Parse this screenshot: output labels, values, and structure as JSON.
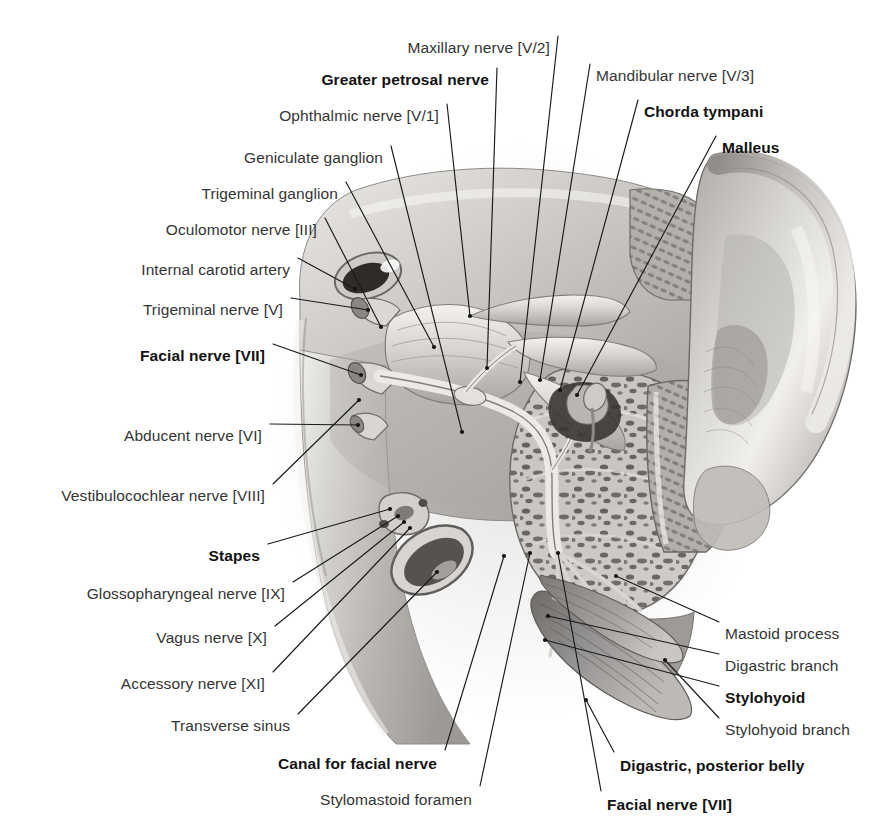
{
  "figure": {
    "domain": "anatomical-illustration",
    "background_color": "#ffffff",
    "label_color": "#343434",
    "bold_label_color": "#121212",
    "leader_line_color": "#1a1a1a",
    "style": "grayscale airbrush medical atlas plate"
  },
  "labels": [
    {
      "id": "maxillary-nerve",
      "text": "Maxillary nerve [V/2]",
      "bold": false,
      "align": "right",
      "x": 550,
      "y": 40,
      "leader": [
        [
          558,
          36
        ],
        [
          520,
          382
        ]
      ]
    },
    {
      "id": "greater-petrosal-nerve",
      "text": "Greater petrosal nerve",
      "bold": true,
      "align": "right",
      "x": 489,
      "y": 72,
      "leader": [
        [
          497,
          68
        ],
        [
          487,
          368
        ]
      ]
    },
    {
      "id": "ophthalmic-nerve",
      "text": "Ophthalmic nerve [V/1]",
      "bold": false,
      "align": "right",
      "x": 439,
      "y": 108,
      "leader": [
        [
          447,
          104
        ],
        [
          470,
          316
        ]
      ]
    },
    {
      "id": "geniculate-ganglion",
      "text": "Geniculate ganglion",
      "bold": false,
      "align": "right",
      "x": 383,
      "y": 150,
      "leader": [
        [
          391,
          146
        ],
        [
          462,
          432
        ]
      ]
    },
    {
      "id": "trigeminal-ganglion",
      "text": "Trigeminal ganglion",
      "bold": false,
      "align": "right",
      "x": 338,
      "y": 186,
      "leader": [
        [
          346,
          182
        ],
        [
          434,
          347
        ]
      ]
    },
    {
      "id": "oculomotor-nerve",
      "text": "Oculomotor nerve [III]",
      "bold": false,
      "align": "right",
      "x": 317,
      "y": 222,
      "leader": [
        [
          325,
          218
        ],
        [
          381,
          327
        ]
      ]
    },
    {
      "id": "internal-carotid-artery",
      "text": "Internal carotid artery",
      "bold": false,
      "align": "right",
      "x": 290,
      "y": 262,
      "leader": [
        [
          298,
          258
        ],
        [
          355,
          289
        ]
      ]
    },
    {
      "id": "trigeminal-nerve",
      "text": "Trigeminal nerve [V]",
      "bold": false,
      "align": "right",
      "x": 283,
      "y": 302,
      "leader": [
        [
          291,
          298
        ],
        [
          368,
          310
        ]
      ]
    },
    {
      "id": "facial-nerve-vii-left",
      "text": "Facial nerve [VII]",
      "bold": true,
      "align": "right",
      "x": 265,
      "y": 348,
      "leader": [
        [
          273,
          344
        ],
        [
          361,
          375
        ]
      ]
    },
    {
      "id": "abducent-nerve",
      "text": "Abducent nerve [VI]",
      "bold": false,
      "align": "right",
      "x": 262,
      "y": 428,
      "leader": [
        [
          270,
          424
        ],
        [
          358,
          425
        ]
      ]
    },
    {
      "id": "vestibulocochlear-nerve",
      "text": "Vestibulocochlear nerve [VIII]",
      "bold": false,
      "align": "right",
      "x": 265,
      "y": 488,
      "leader": [
        [
          273,
          484
        ],
        [
          359,
          400
        ]
      ]
    },
    {
      "id": "stapes",
      "text": "Stapes",
      "bold": true,
      "align": "right",
      "x": 260,
      "y": 548,
      "leader": [
        [
          268,
          544
        ],
        [
          390,
          509
        ]
      ]
    },
    {
      "id": "glossopharyngeal-nerve",
      "text": "Glossopharyngeal nerve [IX]",
      "bold": false,
      "align": "right",
      "x": 285,
      "y": 586,
      "leader": [
        [
          293,
          582
        ],
        [
          398,
          516
        ]
      ]
    },
    {
      "id": "vagus-nerve",
      "text": "Vagus nerve [X]",
      "bold": false,
      "align": "right",
      "x": 267,
      "y": 630,
      "leader": [
        [
          275,
          626
        ],
        [
          404,
          522
        ]
      ]
    },
    {
      "id": "accessory-nerve",
      "text": "Accessory nerve [XI]",
      "bold": false,
      "align": "right",
      "x": 265,
      "y": 676,
      "leader": [
        [
          273,
          672
        ],
        [
          410,
          528
        ]
      ]
    },
    {
      "id": "transverse-sinus",
      "text": "Transverse sinus",
      "bold": false,
      "align": "right",
      "x": 290,
      "y": 718,
      "leader": [
        [
          298,
          714
        ],
        [
          437,
          572
        ]
      ]
    },
    {
      "id": "canal-for-facial-nerve",
      "text": "Canal for facial nerve",
      "bold": true,
      "align": "right",
      "x": 437,
      "y": 756,
      "leader": [
        [
          445,
          750
        ],
        [
          504,
          556
        ]
      ]
    },
    {
      "id": "stylomastoid-foramen",
      "text": "Stylomastoid foramen",
      "bold": false,
      "align": "right",
      "x": 472,
      "y": 792,
      "leader": [
        [
          480,
          786
        ],
        [
          530,
          553
        ]
      ]
    },
    {
      "id": "facial-nerve-vii-bottom",
      "text": "Facial nerve [VII]",
      "bold": false,
      "align": "left",
      "x": 607,
      "y": 797,
      "leader": [
        [
          601,
          791
        ],
        [
          558,
          553
        ]
      ],
      "boldState": true
    },
    {
      "id": "mandibular-nerve",
      "text": "Mandibular nerve [V/3]",
      "bold": false,
      "align": "left",
      "x": 596,
      "y": 68,
      "leader": [
        [
          590,
          64
        ],
        [
          540,
          380
        ]
      ]
    },
    {
      "id": "chorda-tympani",
      "text": "Chorda tympani",
      "bold": true,
      "align": "left",
      "x": 644,
      "y": 104,
      "leader": [
        [
          638,
          100
        ],
        [
          560,
          390
        ]
      ]
    },
    {
      "id": "malleus",
      "text": "Malleus",
      "bold": true,
      "align": "left",
      "x": 722,
      "y": 140,
      "leader": [
        [
          716,
          136
        ],
        [
          577,
          395
        ]
      ]
    },
    {
      "id": "mastoid-process",
      "text": "Mastoid process",
      "bold": false,
      "align": "left",
      "x": 725,
      "y": 626,
      "leader": [
        [
          719,
          622
        ],
        [
          616,
          576
        ]
      ]
    },
    {
      "id": "digastric-branch",
      "text": "Digastric branch",
      "bold": false,
      "align": "left",
      "x": 725,
      "y": 658,
      "leader": [
        [
          719,
          654
        ],
        [
          548,
          616
        ]
      ]
    },
    {
      "id": "stylohyoid",
      "text": "Stylohyoid",
      "bold": true,
      "align": "left",
      "x": 725,
      "y": 690,
      "leader": [
        [
          719,
          686
        ],
        [
          545,
          640
        ]
      ]
    },
    {
      "id": "stylohyoid-branch",
      "text": "Stylohyoid branch",
      "bold": false,
      "align": "left",
      "x": 725,
      "y": 722,
      "leader": [
        [
          719,
          718
        ],
        [
          665,
          660
        ]
      ]
    },
    {
      "id": "digastric-posterior-belly",
      "text": "Digastric, posterior belly",
      "bold": true,
      "align": "left",
      "x": 620,
      "y": 758,
      "leader": [
        [
          614,
          752
        ],
        [
          586,
          700
        ]
      ]
    }
  ],
  "structures": [
    {
      "name": "skull-base-floor",
      "description": "middle cranial fossa floor, light gray airbrushed bone"
    },
    {
      "name": "auricle",
      "description": "external ear, large pale lobed shape at right"
    },
    {
      "name": "external-acoustic-meatus",
      "description": "cartilaginous canal with cross-hatched wall"
    },
    {
      "name": "petrous-temporal-bone",
      "description": "trabecular cancellous bone with dark marrow spaces"
    },
    {
      "name": "internal-carotid-artery-vessel",
      "description": "dark oval vessel lumen upper left"
    },
    {
      "name": "jugular-foramen",
      "description": "dark elongated oval lower left of petrous bone"
    },
    {
      "name": "trigeminal-ganglion-body",
      "description": "broad flattened nerve fan center"
    },
    {
      "name": "digastric-posterior-belly-muscle",
      "description": "striated fan-shaped muscle lower right"
    },
    {
      "name": "stylohyoid-muscle",
      "description": "slender striated muscle adjacent to digastric"
    }
  ]
}
